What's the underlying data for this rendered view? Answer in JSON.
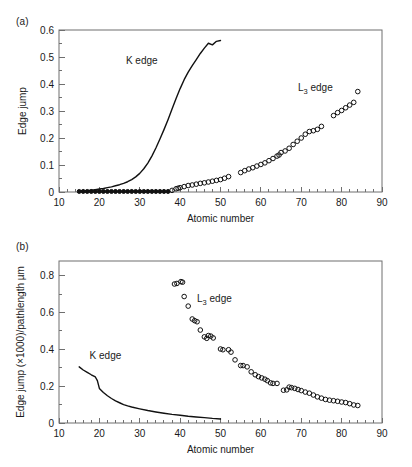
{
  "figure": {
    "panels": [
      {
        "id": "a",
        "label": "(a)",
        "xlabel": "Atomic number",
        "ylabel": "Edge jump"
      },
      {
        "id": "b",
        "label": "(b)",
        "xlabel": "Atomic number",
        "ylabel": "Edge jump (×1000)/pathlength µm"
      }
    ]
  },
  "chart_data": [
    {
      "type": "line",
      "panel": "a",
      "title": "",
      "xlabel": "Atomic number",
      "ylabel": "Edge jump",
      "xlim": [
        10,
        90
      ],
      "ylim": [
        0,
        0.6
      ],
      "xticks": [
        10,
        20,
        30,
        40,
        50,
        60,
        70,
        80,
        90
      ],
      "xticklabels": [
        "10",
        "20",
        "30",
        "40",
        "50",
        "60",
        "70",
        "80",
        "90"
      ],
      "yticks": [
        0,
        0.1,
        0.2,
        0.3,
        0.4,
        0.5,
        0.6
      ],
      "yticklabels": [
        "0",
        "0.1",
        "0.2",
        "0.3",
        "0.4",
        "0.5",
        "0.6"
      ],
      "xminor_interval": 2,
      "yminor_interval": 0.05,
      "grid": false,
      "legend": "inline-annotations",
      "annotations": [
        {
          "text": "K edge",
          "x": 30.5,
          "y": 0.475
        },
        {
          "text": "L₃ edge",
          "x": 73.5,
          "y": 0.375
        }
      ],
      "series": [
        {
          "name": "K edge",
          "marker": "none",
          "style": "solid-line",
          "x": [
            15,
            16,
            17,
            18,
            19,
            20,
            21,
            22,
            23,
            24,
            25,
            26,
            27,
            28,
            29,
            30,
            31,
            32,
            33,
            34,
            35,
            36,
            37,
            38,
            39,
            40,
            41,
            42,
            43,
            44,
            45,
            46,
            47,
            48,
            49,
            50
          ],
          "y": [
            0.003,
            0.004,
            0.005,
            0.007,
            0.009,
            0.011,
            0.013,
            0.016,
            0.019,
            0.023,
            0.027,
            0.032,
            0.038,
            0.046,
            0.056,
            0.069,
            0.086,
            0.107,
            0.133,
            0.163,
            0.196,
            0.231,
            0.268,
            0.307,
            0.346,
            0.383,
            0.416,
            0.444,
            0.468,
            0.49,
            0.513,
            0.533,
            0.551,
            0.545,
            0.558,
            0.561
          ]
        },
        {
          "name": "K edge low-Z markers",
          "marker": "filled-circle",
          "style": "markers",
          "x": [
            15,
            16,
            17,
            18,
            19,
            20,
            21,
            22,
            23,
            24,
            25,
            26,
            27,
            28,
            29,
            30,
            31,
            32,
            33,
            34,
            35,
            36,
            37
          ],
          "y": [
            0.002,
            0.002,
            0.002,
            0.002,
            0.002,
            0.002,
            0.002,
            0.002,
            0.002,
            0.002,
            0.002,
            0.002,
            0.002,
            0.002,
            0.002,
            0.002,
            0.002,
            0.002,
            0.002,
            0.002,
            0.002,
            0.002,
            0.002
          ]
        },
        {
          "name": "L3 edge",
          "marker": "open-circle",
          "style": "markers",
          "x": [
            38,
            39,
            39.5,
            40,
            41,
            42,
            43,
            44,
            45,
            46,
            47,
            48,
            49,
            50,
            51,
            52,
            55,
            56,
            57,
            58,
            59,
            60,
            61,
            62,
            63,
            64,
            64.5,
            65,
            66,
            67,
            68,
            69,
            70,
            71,
            72,
            73,
            74,
            75,
            78,
            79,
            80,
            81,
            82,
            83,
            84
          ],
          "y": [
            0.006,
            0.012,
            0.014,
            0.016,
            0.02,
            0.024,
            0.026,
            0.029,
            0.032,
            0.034,
            0.037,
            0.04,
            0.043,
            0.046,
            0.051,
            0.057,
            0.072,
            0.079,
            0.085,
            0.09,
            0.096,
            0.102,
            0.108,
            0.116,
            0.124,
            0.133,
            0.137,
            0.146,
            0.152,
            0.162,
            0.176,
            0.188,
            0.2,
            0.214,
            0.224,
            0.227,
            0.232,
            0.243,
            0.283,
            0.294,
            0.302,
            0.312,
            0.322,
            0.332,
            0.372
          ]
        }
      ]
    },
    {
      "type": "line",
      "panel": "b",
      "title": "",
      "xlabel": "Atomic number",
      "ylabel": "Edge jump (×1000)/pathlength µm",
      "xlim": [
        10,
        90
      ],
      "ylim": [
        0,
        0.88
      ],
      "xticks": [
        10,
        20,
        30,
        40,
        50,
        60,
        70,
        80,
        90
      ],
      "xticklabels": [
        "10",
        "20",
        "30",
        "40",
        "50",
        "60",
        "70",
        "80",
        "90"
      ],
      "yticks": [
        0,
        0.2,
        0.4,
        0.6,
        0.8
      ],
      "yticklabels": [
        "0",
        "0.2",
        "0.4",
        "0.6",
        "0.8"
      ],
      "xminor_interval": 2,
      "yminor_interval": 0.1,
      "grid": false,
      "legend": "inline-annotations",
      "annotations": [
        {
          "text": "K edge",
          "x": 21.5,
          "y": 0.345
        },
        {
          "text": "L₃ edge",
          "x": 48.5,
          "y": 0.655
        }
      ],
      "series": [
        {
          "name": "K edge",
          "marker": "none",
          "style": "solid-line",
          "x": [
            15,
            16,
            17,
            18,
            19,
            19.5,
            20,
            21,
            22,
            23,
            24,
            25,
            26,
            27,
            28,
            30,
            32,
            34,
            36,
            38,
            40,
            42,
            44,
            46,
            48,
            50
          ],
          "y": [
            0.305,
            0.288,
            0.275,
            0.262,
            0.25,
            0.23,
            0.188,
            0.166,
            0.148,
            0.133,
            0.12,
            0.11,
            0.1,
            0.093,
            0.087,
            0.077,
            0.068,
            0.06,
            0.053,
            0.047,
            0.042,
            0.037,
            0.033,
            0.029,
            0.025,
            0.022
          ]
        },
        {
          "name": "L3 edge",
          "marker": "open-circle",
          "style": "markers",
          "x": [
            38.6,
            39.2,
            40.2,
            40.6,
            41,
            42,
            43,
            43.6,
            44.2,
            45,
            46,
            46.6,
            47,
            47.6,
            48.2,
            50,
            50.6,
            52,
            52.6,
            53.6,
            55,
            55.6,
            56.6,
            57.6,
            58.6,
            59.4,
            60.2,
            61,
            61.6,
            62.4,
            63,
            64,
            65.6,
            66.4,
            67,
            67.6,
            68.4,
            69.2,
            70,
            71,
            72,
            73,
            74,
            75,
            76,
            77,
            78,
            79,
            80,
            81,
            82,
            83,
            84
          ],
          "y": [
            0.755,
            0.758,
            0.768,
            0.765,
            0.687,
            0.635,
            0.565,
            0.556,
            0.55,
            0.505,
            0.468,
            0.46,
            0.475,
            0.472,
            0.462,
            0.402,
            0.398,
            0.398,
            0.385,
            0.343,
            0.312,
            0.312,
            0.305,
            0.278,
            0.262,
            0.252,
            0.245,
            0.238,
            0.23,
            0.218,
            0.215,
            0.215,
            0.178,
            0.18,
            0.195,
            0.192,
            0.188,
            0.182,
            0.176,
            0.168,
            0.162,
            0.152,
            0.142,
            0.135,
            0.128,
            0.124,
            0.121,
            0.118,
            0.114,
            0.111,
            0.105,
            0.098,
            0.095
          ]
        }
      ]
    }
  ]
}
